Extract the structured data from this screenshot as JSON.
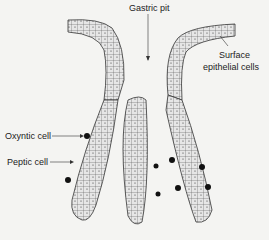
{
  "diagram": {
    "labels": {
      "gastric_pit": "Gastric pit",
      "surface_epithelial": "Surface epithelial cells",
      "surface_line1": "Surface",
      "surface_line2": "epithelial cells",
      "oxyntic_cell": "Oxyntic cell",
      "peptic_cell": "Peptic cell"
    },
    "colors": {
      "background": "#f4f4f2",
      "cell_fill": "#d9d9d9",
      "outline": "#333333",
      "oxyntic_dot": "#111111"
    }
  }
}
